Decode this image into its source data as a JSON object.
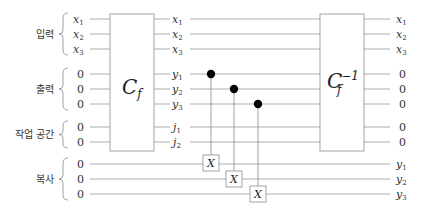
{
  "groups": [
    {
      "label": "입력",
      "inputs": [
        "x1",
        "x2",
        "x3"
      ]
    },
    {
      "label": "출력",
      "inputs": [
        "0",
        "0",
        "0"
      ]
    },
    {
      "label": "작업 공간",
      "inputs": [
        "0",
        "0"
      ]
    },
    {
      "label": "복사",
      "inputs": [
        "0",
        "0",
        "0"
      ]
    }
  ],
  "gates": {
    "cf": {
      "main": "C",
      "sub": "f"
    },
    "cf_inv": {
      "main": "C",
      "sub": "f",
      "sup": "−1"
    },
    "cnot_target": "X"
  },
  "inputs_left": {
    "x1": {
      "var": "x",
      "idx": "1"
    },
    "x2": {
      "var": "x",
      "idx": "2"
    },
    "x3": {
      "var": "x",
      "idx": "3"
    },
    "zero": "0"
  },
  "mid_labels": [
    {
      "var": "x",
      "idx": "1"
    },
    {
      "var": "x",
      "idx": "2"
    },
    {
      "var": "x",
      "idx": "3"
    },
    {
      "var": "y",
      "idx": "1"
    },
    {
      "var": "y",
      "idx": "2"
    },
    {
      "var": "y",
      "idx": "3"
    },
    {
      "var": "j",
      "idx": "1"
    },
    {
      "var": "j",
      "idx": "2"
    }
  ],
  "outputs_right": [
    {
      "var": "x",
      "idx": "1"
    },
    {
      "var": "x",
      "idx": "2"
    },
    {
      "var": "x",
      "idx": "3"
    },
    {
      "zero": "0"
    },
    {
      "zero": "0"
    },
    {
      "zero": "0"
    },
    {
      "zero": "0"
    },
    {
      "zero": "0"
    },
    {
      "var": "y",
      "idx": "1"
    },
    {
      "var": "y",
      "idx": "2"
    },
    {
      "var": "y",
      "idx": "3"
    }
  ]
}
